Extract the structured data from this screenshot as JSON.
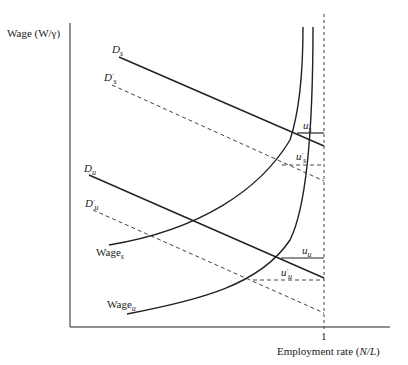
{
  "diagram": {
    "y_axis_label": "Wage (W/γ)",
    "x_axis_label_prefix": "Employment rate (",
    "x_axis_label_var": "N/L",
    "x_axis_label_suffix": ")",
    "x_tick_label": "1",
    "labels": {
      "Ds_main": "D",
      "Ds_sub": "s",
      "Dps_main": "D",
      "Dps_sup": "'",
      "Dps_sub": "s",
      "Du_main": "D",
      "Du_sub": "u",
      "Dpu_main": "D",
      "Dpu_sup": "'",
      "Dpu_sub": "u",
      "Wages_main": "Wage",
      "Wages_sub": "s",
      "Wageu_main": "Wage",
      "Wageu_sub": "u",
      "us_main": "u",
      "us_sub": "s",
      "ups_main": "u",
      "ups_sup": "'",
      "ups_sub": "s",
      "uu_main": "u",
      "uu_sub": "u",
      "upu_main": "u",
      "upu_sup": "'",
      "upu_sub": "u"
    },
    "colors": {
      "line": "#222222",
      "dashed": "#444444"
    }
  }
}
